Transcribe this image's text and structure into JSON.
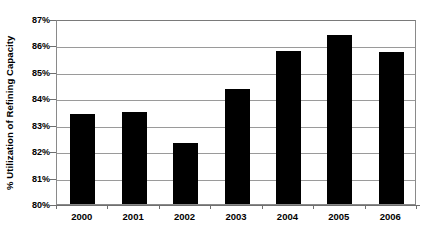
{
  "chart_data": {
    "type": "bar",
    "title": "",
    "xlabel": "",
    "ylabel": "% Utilization of Refining Capacity",
    "categories": [
      "2000",
      "2001",
      "2002",
      "2003",
      "2004",
      "2005",
      "2006"
    ],
    "values": [
      83.4,
      83.5,
      82.3,
      84.35,
      85.8,
      86.4,
      85.75
    ],
    "ylim": [
      80,
      87
    ],
    "ytick_values": [
      80,
      81,
      82,
      83,
      84,
      85,
      86,
      87
    ],
    "ytick_labels": [
      "80%",
      "81%",
      "82%",
      "83%",
      "84%",
      "85%",
      "86%",
      "87%"
    ],
    "grid": true,
    "legend": null,
    "series": [
      {
        "name": "% Utilization of Refining Capacity",
        "color": "#000000",
        "values": [
          83.4,
          83.5,
          82.3,
          84.35,
          85.8,
          86.4,
          85.75
        ]
      }
    ]
  },
  "figure": {
    "background_color": "#ffffff",
    "bar_color": "#000000",
    "gridline_color": "#9a9a9a",
    "axis_color": "#6f6f6f"
  }
}
